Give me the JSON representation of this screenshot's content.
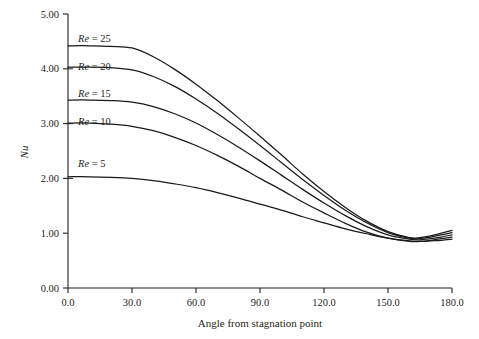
{
  "chart_data": {
    "type": "line",
    "title": "",
    "xlabel": "Angle from stagnation point",
    "ylabel": "Nu",
    "xlim": [
      0,
      180
    ],
    "ylim": [
      0,
      5
    ],
    "grid": false,
    "legend_position": "inline-left",
    "x_ticks": [
      "0.0",
      "30.0",
      "60.0",
      "90.0",
      "120.0",
      "150.0",
      "180.0"
    ],
    "x_tick_values": [
      0,
      30,
      60,
      90,
      120,
      150,
      180
    ],
    "y_ticks": [
      "0.00",
      "1.00",
      "2.00",
      "3.00",
      "4.00",
      "5.00"
    ],
    "y_tick_values": [
      0,
      1,
      2,
      3,
      4,
      5
    ],
    "y_minor_tick_values": [
      2,
      3,
      4
    ],
    "x": [
      0,
      10,
      20,
      30,
      40,
      50,
      60,
      70,
      80,
      90,
      100,
      110,
      120,
      130,
      140,
      150,
      160,
      165,
      170,
      175,
      180
    ],
    "series": [
      {
        "name": "Re = 25",
        "label": "Re = 25",
        "re": 25,
        "values": [
          4.42,
          4.42,
          4.41,
          4.38,
          4.22,
          3.99,
          3.72,
          3.42,
          3.1,
          2.77,
          2.43,
          2.08,
          1.76,
          1.47,
          1.22,
          1.03,
          0.92,
          0.92,
          0.95,
          1.0,
          1.05
        ]
      },
      {
        "name": "Re = 20",
        "label": "Re = 20",
        "re": 20,
        "values": [
          4.03,
          4.03,
          4.02,
          3.98,
          3.86,
          3.68,
          3.45,
          3.19,
          2.9,
          2.6,
          2.29,
          1.98,
          1.69,
          1.42,
          1.19,
          1.01,
          0.91,
          0.9,
          0.93,
          0.97,
          1.01
        ]
      },
      {
        "name": "Re = 15",
        "label": "Re = 15",
        "re": 15,
        "values": [
          3.43,
          3.43,
          3.42,
          3.39,
          3.31,
          3.18,
          3.01,
          2.8,
          2.57,
          2.32,
          2.06,
          1.8,
          1.55,
          1.32,
          1.12,
          0.97,
          0.89,
          0.88,
          0.9,
          0.93,
          0.97
        ]
      },
      {
        "name": "Re = 10",
        "label": "Re = 10",
        "re": 10,
        "values": [
          3.01,
          3.01,
          2.99,
          2.95,
          2.87,
          2.75,
          2.6,
          2.42,
          2.22,
          2.0,
          1.79,
          1.57,
          1.37,
          1.18,
          1.02,
          0.91,
          0.85,
          0.85,
          0.87,
          0.9,
          0.93
        ]
      },
      {
        "name": "Re = 5",
        "label": "Re = 5",
        "re": 5,
        "values": [
          2.03,
          2.03,
          2.02,
          2.0,
          1.96,
          1.9,
          1.83,
          1.74,
          1.64,
          1.53,
          1.42,
          1.3,
          1.19,
          1.08,
          0.99,
          0.91,
          0.86,
          0.85,
          0.86,
          0.87,
          0.89
        ]
      }
    ],
    "series_label_positions": [
      {
        "label": "Re = 25",
        "x_px": 78,
        "y_px": 42
      },
      {
        "label": "Re = 20",
        "x_px": 78,
        "y_px": 70
      },
      {
        "label": "Re = 15",
        "x_px": 78,
        "y_px": 97
      },
      {
        "label": "Re = 10",
        "x_px": 78,
        "y_px": 125
      },
      {
        "label": "Re = 5",
        "x_px": 78,
        "y_px": 167
      }
    ],
    "colors": {
      "line": "#1a1a1a",
      "axis": "#231f20",
      "background": "#ffffff"
    }
  }
}
